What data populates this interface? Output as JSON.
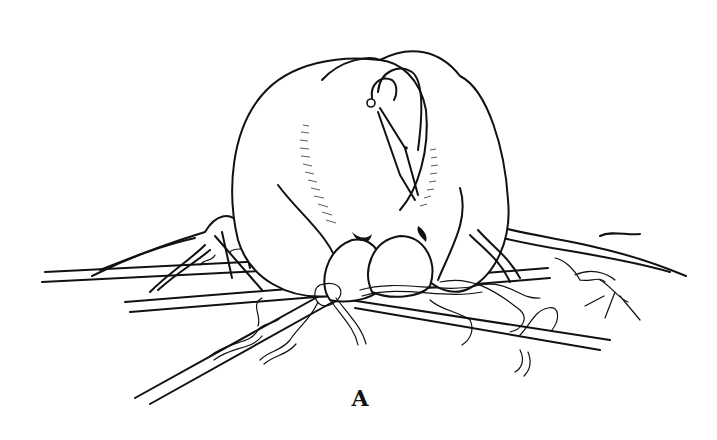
{
  "figure": {
    "label": "A",
    "style": "black ink line drawing on white",
    "colors": {
      "ink": "#111111",
      "background": "#ffffff"
    }
  }
}
